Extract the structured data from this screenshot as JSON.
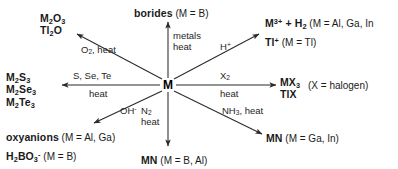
{
  "diagram": {
    "type": "radial-reaction-scheme",
    "center_label": "M",
    "line_color": "#2b2b2b",
    "text_color": "#1a1a1a"
  },
  "branches": [
    {
      "id": "borides",
      "direction": "up",
      "reagents": "metals",
      "conditions": "heat",
      "product_html": "borides",
      "qualifier": "(M = B)"
    },
    {
      "id": "oxides",
      "direction": "up-left",
      "reagents": "O2, heat",
      "conditions": "",
      "product_lines": [
        "M2O3",
        "Tl2O"
      ],
      "qualifier": ""
    },
    {
      "id": "acid-hydrogen",
      "direction": "up-right",
      "reagents": "H+",
      "conditions": "",
      "product_lines": [
        "M3+ + H2",
        "Tl+"
      ],
      "qualifiers": [
        "(M = Al, Ga, In",
        "(M = Tl)"
      ]
    },
    {
      "id": "chalcogenides",
      "direction": "left",
      "reagents": "S, Se, Te",
      "conditions": "heat",
      "product_lines": [
        "M2S3",
        "M2Se3",
        "M2Te3"
      ],
      "qualifier": ""
    },
    {
      "id": "halides",
      "direction": "right",
      "reagents": "X2",
      "conditions": "heat",
      "product_lines": [
        "MX3",
        "TlX"
      ],
      "qualifier": "(X = halogen)"
    },
    {
      "id": "oxyanions",
      "direction": "down-left",
      "reagents": "OH-",
      "conditions": "",
      "product_lines": [
        "oxyanions",
        "H2BO3-"
      ],
      "qualifiers": [
        "(M = Al, Ga)",
        "(M = B)"
      ]
    },
    {
      "id": "nitrides-n2",
      "direction": "down",
      "reagents": "N2",
      "conditions": "heat",
      "product_html": "MN",
      "qualifier": "(M = B, Al)"
    },
    {
      "id": "nitrides-nh3",
      "direction": "down-right",
      "reagents": "NH3, heat",
      "conditions": "",
      "product_html": "MN",
      "qualifier": "(M = Ga, In)"
    }
  ],
  "text": {
    "center_m": "M",
    "borides_name": "borides",
    "borides_qual": "(M = B)",
    "borides_reagent": "metals",
    "borides_cond": "heat",
    "oxide_line1_pre": "M",
    "oxide_line1_sub": "2",
    "oxide_line1_mid": "O",
    "oxide_line1_sub2": "3",
    "oxide_line2": "Tl2O",
    "oxide_reagent": "O2, heat",
    "acid_reagent": "H+",
    "acid_line1": "M3+ + H2",
    "acid_qual1": "(M = Al, Ga, In",
    "acid_line2": "Tl+",
    "acid_qual2": "(M = Tl)",
    "chalc_reagent": "S, Se, Te",
    "chalc_cond": "heat",
    "chalc_line1": "M2S3",
    "chalc_line2": "M2Se3",
    "chalc_line3": "M2Te3",
    "halide_reagent": "X2",
    "halide_cond": "heat",
    "halide_line1": "MX3",
    "halide_line2": "TlX",
    "halide_qual": "(X = halogen)",
    "oh_reagent": "OH-",
    "oxy_line1": "oxyanions",
    "oxy_qual1": "(M = Al, Ga)",
    "oxy_line2": "H2BO3-",
    "oxy_qual2": "(M = B)",
    "n2_reagent": "N2",
    "n2_cond": "heat",
    "n2_product": "MN",
    "n2_qual": "(M = B, Al)",
    "nh3_reagent": "NH3, heat",
    "nh3_product": "MN",
    "nh3_qual": "(M = Ga, In)"
  }
}
